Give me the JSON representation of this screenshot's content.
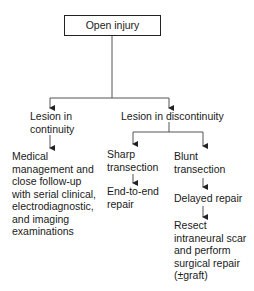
{
  "diagram": {
    "root": {
      "label": "Open injury"
    },
    "branches": {
      "continuity": {
        "label_lines": [
          "Lesion in",
          "continuity"
        ],
        "outcome_lines": [
          "Medical",
          "management and",
          "close follow-up",
          "with serial clinical,",
          "electrodiagnostic,",
          "and imaging",
          "examinations"
        ]
      },
      "discontinuity": {
        "label": "Lesion in discontinuity",
        "sharp": {
          "label_lines": [
            "Sharp",
            "transection"
          ],
          "outcome_lines": [
            "End-to-end",
            "repair"
          ]
        },
        "blunt": {
          "label_lines": [
            "Blunt",
            "transection"
          ],
          "step1": "Delayed repair",
          "step2_lines": [
            "Resect",
            "intraneural scar",
            "and perform",
            "surgical repair",
            "(±graft)"
          ]
        }
      }
    },
    "colors": {
      "line": "#555555",
      "text": "#1a1a1a",
      "box_border": "#222222"
    }
  }
}
